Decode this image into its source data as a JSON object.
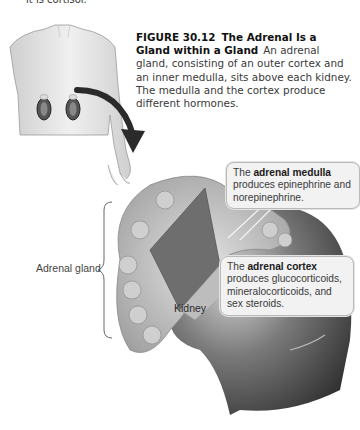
{
  "page": {
    "top_fragment": "it is cortisol."
  },
  "figure": {
    "number": "FIGURE 30.12",
    "title": "The Adrenal Is a Gland within a Gland",
    "caption": "An adrenal gland, consisting of an outer cortex and an inner medulla, sits above each kidney. The medulla and the cortex produce different hormones."
  },
  "labels": {
    "adrenal_gland": "Adrenal gland",
    "kidney": "Kidney"
  },
  "callouts": {
    "medulla": {
      "prefix": "The ",
      "term": "adrenal medulla",
      "text": " produces epinephrine and norepinephrine."
    },
    "cortex": {
      "prefix": "The ",
      "term": "adrenal cortex",
      "text": " produces glucocorticoids, mineralocorticoids, and sex steroids."
    }
  },
  "colors": {
    "callout_bg": "#f2f2f2",
    "callout_border": "#b9b9b9",
    "kidney_dark": "#3c3c3c",
    "gland_light": "#c9c9c9"
  }
}
